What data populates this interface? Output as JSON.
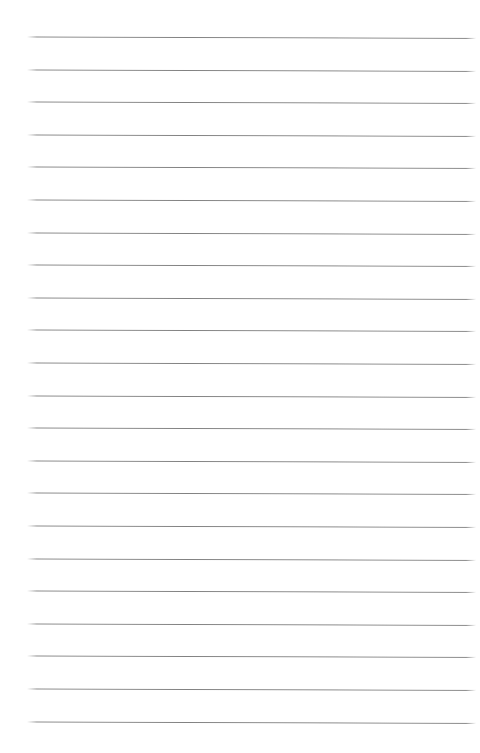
{
  "page": {
    "name": "ruled-notebook-paper",
    "kind": "blank lined paper",
    "width": 480,
    "height": 753,
    "background_color": "#ffffff",
    "content_text": "",
    "is_blank": true
  },
  "rules": {
    "count": 22,
    "color": "#7a7a7a",
    "thickness_px": 1,
    "first_line_y": 37,
    "last_line_y": 722,
    "spacing_px": 32.62,
    "left_x": 27,
    "right_x": 476,
    "slant_deg": 0.18,
    "lines": [
      {
        "index": 1,
        "y": 37,
        "left_x": 27,
        "right_x": 476
      },
      {
        "index": 2,
        "y": 70,
        "left_x": 27,
        "right_x": 476
      },
      {
        "index": 3,
        "y": 102,
        "left_x": 27,
        "right_x": 476
      },
      {
        "index": 4,
        "y": 135,
        "left_x": 27,
        "right_x": 476
      },
      {
        "index": 5,
        "y": 167,
        "left_x": 27,
        "right_x": 476
      },
      {
        "index": 6,
        "y": 200,
        "left_x": 27,
        "right_x": 476
      },
      {
        "index": 7,
        "y": 233,
        "left_x": 27,
        "right_x": 476
      },
      {
        "index": 8,
        "y": 265,
        "left_x": 27,
        "right_x": 476
      },
      {
        "index": 9,
        "y": 298,
        "left_x": 27,
        "right_x": 476
      },
      {
        "index": 10,
        "y": 330,
        "left_x": 27,
        "right_x": 476
      },
      {
        "index": 11,
        "y": 363,
        "left_x": 27,
        "right_x": 476
      },
      {
        "index": 12,
        "y": 396,
        "left_x": 27,
        "right_x": 476
      },
      {
        "index": 13,
        "y": 428,
        "left_x": 27,
        "right_x": 476
      },
      {
        "index": 14,
        "y": 461,
        "left_x": 27,
        "right_x": 476
      },
      {
        "index": 15,
        "y": 493,
        "left_x": 27,
        "right_x": 476
      },
      {
        "index": 16,
        "y": 526,
        "left_x": 27,
        "right_x": 476
      },
      {
        "index": 17,
        "y": 559,
        "left_x": 27,
        "right_x": 476
      },
      {
        "index": 18,
        "y": 591,
        "left_x": 27,
        "right_x": 476
      },
      {
        "index": 19,
        "y": 624,
        "left_x": 27,
        "right_x": 476
      },
      {
        "index": 20,
        "y": 656,
        "left_x": 27,
        "right_x": 476
      },
      {
        "index": 21,
        "y": 689,
        "left_x": 27,
        "right_x": 476
      },
      {
        "index": 22,
        "y": 722,
        "left_x": 27,
        "right_x": 476
      }
    ]
  },
  "write_rows": {
    "count": 22,
    "note": "blank writing bands; all empty",
    "values": [
      "",
      "",
      "",
      "",
      "",
      "",
      "",
      "",
      "",
      "",
      "",
      "",
      "",
      "",
      "",
      "",
      "",
      "",
      "",
      "",
      "",
      ""
    ]
  }
}
